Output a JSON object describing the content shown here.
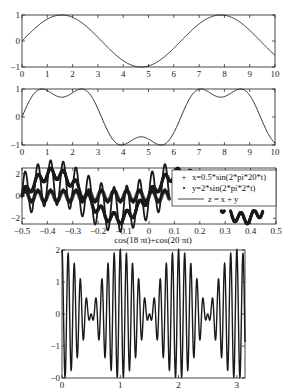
{
  "figure": {
    "width": 291,
    "height": 391,
    "background": "#ffffff",
    "ink_color": "#1a1a1a"
  },
  "chart_data": [
    {
      "id": "subplot-1",
      "type": "line",
      "title": "",
      "xlabel": "",
      "ylabel": "",
      "function": "sin(x)",
      "xlim": [
        0,
        10
      ],
      "ylim": [
        -1,
        1
      ],
      "xticks": [
        0,
        1,
        2,
        3,
        4,
        5,
        6,
        7,
        8,
        9,
        10
      ],
      "xtick_labels": [
        "0",
        "1",
        "2",
        "3",
        "4",
        "5",
        "6",
        "7",
        "8",
        "9",
        "10"
      ],
      "yticks": [
        -1,
        0,
        1
      ],
      "ytick_labels": [
        "-1",
        "0",
        "1"
      ],
      "grid": false,
      "box": {
        "left": 22,
        "top": 15,
        "right": 275,
        "bottom": 67
      },
      "series": [
        {
          "name": "y",
          "x": [
            0,
            0.5,
            1,
            1.57,
            2,
            2.5,
            3,
            3.5,
            4,
            4.71,
            5,
            5.5,
            6,
            6.5,
            7,
            7.85,
            8.5,
            9,
            9.5,
            10
          ],
          "y": [
            0,
            0.48,
            0.84,
            1.0,
            0.91,
            0.6,
            0.14,
            -0.35,
            -0.76,
            -1.0,
            -0.96,
            -0.71,
            -0.28,
            0.22,
            0.66,
            1.0,
            0.8,
            0.41,
            -0.08,
            -0.54
          ]
        }
      ]
    },
    {
      "id": "subplot-2",
      "type": "line",
      "title": "",
      "xlabel": "",
      "ylabel": "",
      "function": "sin(x)+sin(3x)/3 (square-wave partial sum)",
      "xlim": [
        0,
        10
      ],
      "ylim": [
        -1,
        1
      ],
      "xticks": [
        0,
        1,
        2,
        3,
        4,
        5,
        6,
        7,
        8,
        9,
        10
      ],
      "xtick_labels": [
        "0",
        "1",
        "2",
        "3",
        "4",
        "5",
        "6",
        "7",
        "8",
        "9",
        "10"
      ],
      "yticks": [
        -1,
        0,
        1
      ],
      "ytick_labels": [
        "-1",
        "0",
        "1"
      ],
      "grid": false,
      "box": {
        "left": 22,
        "top": 89,
        "right": 275,
        "bottom": 145
      },
      "series": [
        {
          "name": "y",
          "x": [
            0,
            0.79,
            1.57,
            2.36,
            3.14,
            3.93,
            4.71,
            5.5,
            6.28,
            7.07,
            7.85,
            8.64,
            9.42,
            10
          ],
          "y": [
            0,
            1.0,
            0.71,
            1.0,
            0,
            -1.0,
            -0.71,
            -1.0,
            0,
            1.0,
            0.71,
            1.0,
            0,
            -0.8
          ]
        }
      ]
    },
    {
      "id": "subplot-3",
      "type": "line",
      "title": "",
      "xlabel": "",
      "ylabel": "",
      "xlim": [
        -0.5,
        0.5
      ],
      "ylim": [
        -2.5,
        2.5
      ],
      "xticks": [
        -0.5,
        -0.4,
        -0.3,
        -0.2,
        -0.1,
        0,
        0.1,
        0.2,
        0.3,
        0.4,
        0.5
      ],
      "xtick_labels": [
        "-0.5",
        "-0.4",
        "-0.3",
        "-0.2",
        "-0.1",
        "0",
        "0.1",
        "0.2",
        "0.3",
        "0.4",
        "0.5"
      ],
      "yticks": [
        -2,
        0,
        2
      ],
      "ytick_labels": [
        "-2",
        "0",
        "2"
      ],
      "grid": false,
      "box": {
        "left": 22,
        "top": 168,
        "right": 276,
        "bottom": 224
      },
      "legend": {
        "position": "northeast",
        "box": {
          "left": 172,
          "top": 170,
          "right": 276,
          "bottom": 206
        },
        "entries": [
          {
            "marker": "+",
            "label": "x=0.5*sin(2*pi*20*t)"
          },
          {
            "marker": "•",
            "label": "y=2*sin(2*pi*2*t)"
          },
          {
            "marker": "line",
            "label": "z = x + y"
          }
        ]
      },
      "series": [
        {
          "name": "x=0.5*sin(2*pi*20*t)",
          "style": "+",
          "amplitude": 0.5,
          "frequency": 20
        },
        {
          "name": "y=2*sin(2*pi*2*t)",
          "style": "•",
          "amplitude": 2,
          "frequency": 2
        },
        {
          "name": "z = x + y",
          "style": "-",
          "definition": "x + y"
        }
      ]
    },
    {
      "id": "subplot-4",
      "type": "line",
      "title": "cos(18 πt)+cos(20 πt)",
      "xlabel": "",
      "ylabel": "",
      "xlim": [
        0,
        3.14
      ],
      "ylim": [
        -2,
        2
      ],
      "xticks": [
        0,
        1,
        2,
        3
      ],
      "xtick_labels": [
        "0",
        "1",
        "2",
        "3"
      ],
      "yticks": [
        2,
        1,
        0,
        -1,
        -2
      ],
      "ytick_labels": [
        "2",
        "1",
        "0",
        "-1",
        "-0"
      ],
      "grid": false,
      "box": {
        "left": 62,
        "top": 250,
        "right": 245,
        "bottom": 378
      },
      "series": [
        {
          "name": "cos(18πt)+cos(20πt)",
          "components": [
            {
              "amplitude": 1,
              "omega_over_pi": 18
            },
            {
              "amplitude": 1,
              "omega_over_pi": 20
            }
          ],
          "envelope_peaks_t": [
            0,
            1,
            2,
            3
          ],
          "envelope_nulls_t": [
            0.5,
            1.5,
            2.5
          ]
        }
      ]
    }
  ]
}
